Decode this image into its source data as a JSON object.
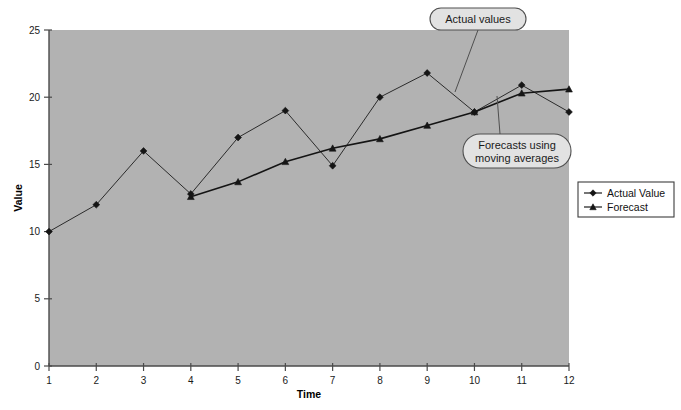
{
  "chart_data": {
    "type": "line",
    "title": "",
    "xlabel": "Time",
    "ylabel": "Value",
    "x": [
      1,
      2,
      3,
      4,
      5,
      6,
      7,
      8,
      9,
      10,
      11,
      12
    ],
    "xticklabels": [
      "1",
      "2",
      "3",
      "4",
      "5",
      "6",
      "7",
      "8",
      "9",
      "10",
      "11",
      "12"
    ],
    "yticklabels": [
      "0",
      "5",
      "10",
      "15",
      "20",
      "25"
    ],
    "yticks": [
      0,
      5,
      10,
      15,
      20,
      25
    ],
    "xlim": [
      1,
      12
    ],
    "ylim": [
      0,
      25
    ],
    "grid": false,
    "legend_position": "right",
    "plot_background": "#b2b2b2",
    "series": [
      {
        "name": "Actual Value",
        "marker": "diamond",
        "color": "#2b2b2b",
        "x": [
          1,
          2,
          3,
          4,
          5,
          6,
          7,
          8,
          9,
          10,
          11,
          12
        ],
        "values": [
          10.0,
          12.0,
          16.0,
          12.8,
          17.0,
          19.0,
          14.9,
          20.0,
          21.8,
          18.9,
          20.9,
          18.9
        ]
      },
      {
        "name": "Forecast",
        "marker": "triangle",
        "color": "#141414",
        "x": [
          4,
          5,
          6,
          7,
          8,
          9,
          10,
          11,
          12
        ],
        "values": [
          12.6,
          13.7,
          15.2,
          16.2,
          16.9,
          17.9,
          18.9,
          20.3,
          20.6
        ]
      }
    ],
    "annotations": [
      {
        "id": "actual-values-callout",
        "text": "Actual values",
        "lines": [
          "Actual values"
        ],
        "target_x": 8.0,
        "target_y": 20.0
      },
      {
        "id": "forecasts-callout",
        "text": "Forecasts using moving averages",
        "lines": [
          "Forecasts using",
          "moving averages"
        ],
        "target_x": 11.0,
        "target_y": 20.3
      }
    ]
  },
  "legend": {
    "items": [
      {
        "label": "Actual Value",
        "marker": "diamond"
      },
      {
        "label": "Forecast",
        "marker": "triangle"
      }
    ]
  },
  "axes": {
    "x_title": "Time",
    "y_title": "Value"
  }
}
